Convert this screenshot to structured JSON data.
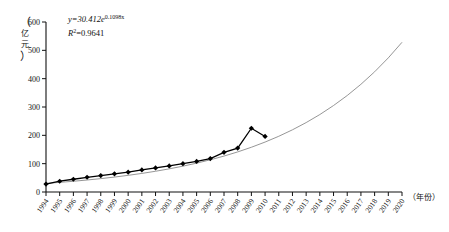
{
  "chart_data": {
    "type": "line",
    "title": "",
    "xlabel": "（年份）",
    "ylabel": "（亿元）",
    "ylabel_chars": [
      "亿",
      "元"
    ],
    "xlim": [
      1994,
      2020
    ],
    "ylim": [
      0,
      600
    ],
    "grid": false,
    "legend": null,
    "y_ticks": [
      0,
      100,
      200,
      300,
      400,
      500,
      600
    ],
    "y_tick_labels": [
      "0",
      "100",
      "200",
      "300",
      "400",
      "500",
      "600"
    ],
    "x_ticks": [
      1994,
      1995,
      1996,
      1997,
      1998,
      1999,
      2000,
      2001,
      2002,
      2003,
      2004,
      2005,
      2006,
      2007,
      2008,
      2009,
      2010,
      2011,
      2012,
      2013,
      2014,
      2015,
      2016,
      2017,
      2018,
      2019,
      2020
    ],
    "x_tick_labels": [
      "1994",
      "1995",
      "1996",
      "1997",
      "1998",
      "1999",
      "2000",
      "2001",
      "2002",
      "2003",
      "2004",
      "2005",
      "2006",
      "2007",
      "2008",
      "2009",
      "2010",
      "2011",
      "2012",
      "2013",
      "2014",
      "2015",
      "2016",
      "2017",
      "2018",
      "2019",
      "2020"
    ],
    "annotations": [
      {
        "name": "regression-equation",
        "text": "y=30.412e0.1098x",
        "base": "y=30.412e",
        "exponent": "0.1098x"
      },
      {
        "name": "r-squared",
        "text": "R2=0.9641",
        "symbol": "R",
        "superscript": "2",
        "value": "=0.9641"
      }
    ],
    "series": [
      {
        "name": "observed",
        "style": "line-marker",
        "marker": "diamond",
        "color": "#000000",
        "x": [
          1994,
          1995,
          1996,
          1997,
          1998,
          1999,
          2000,
          2001,
          2002,
          2003,
          2004,
          2005,
          2006,
          2007,
          2008,
          2009,
          2010
        ],
        "values": [
          28,
          38,
          45,
          52,
          58,
          64,
          70,
          78,
          85,
          92,
          100,
          108,
          118,
          140,
          155,
          225,
          196
        ]
      },
      {
        "name": "exponential-trend",
        "style": "line",
        "color": "#888888",
        "equation": "y=30.412e^(0.1098x)",
        "r_squared": "0.9641",
        "x": [
          1994,
          1995,
          1996,
          1997,
          1998,
          1999,
          2000,
          2001,
          2002,
          2003,
          2004,
          2005,
          2006,
          2007,
          2008,
          2009,
          2010,
          2011,
          2012,
          2013,
          2014,
          2015,
          2016,
          2017,
          2018,
          2019,
          2020
        ],
        "values": [
          30.4,
          34.0,
          37.9,
          42.3,
          47.2,
          52.7,
          58.8,
          65.6,
          73.2,
          81.7,
          91.2,
          101.8,
          113.6,
          126.8,
          141.5,
          157.9,
          176.3,
          196.7,
          219.5,
          245.0,
          273.4,
          305.2,
          340.6,
          380.1,
          424.2,
          473.4,
          528.4
        ]
      }
    ]
  }
}
